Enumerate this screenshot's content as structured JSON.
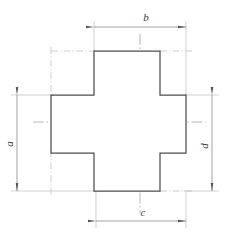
{
  "drawing": {
    "type": "engineering-dimension-drawing",
    "shape": "cross",
    "background_color": "#ffffff",
    "outline_color": "#4d4d4d",
    "dimension_line_color": "#8a8a8a",
    "centerline_color": "#9a9a9a",
    "extension_line_color": "#b0b0b0",
    "label_color": "#3a3a3a",
    "canvas": {
      "width": 243,
      "height": 241
    },
    "outline_points": "94,51 160,51 160,95 186,95 186,153 160,153 160,191 94,191 94,153 51,153 51,95 94,95",
    "geometry": {
      "left": 51,
      "right": 186,
      "top": 51,
      "bottom": 191,
      "arm_left": 94,
      "arm_right": 160,
      "arm_top": 95,
      "arm_bottom": 153
    },
    "centerlines": {
      "horizontal": {
        "x1": 33,
        "y1": 122,
        "x2": 206,
        "y2": 122
      },
      "vertical": {
        "x1": 140,
        "y1": 34,
        "x2": 140,
        "y2": 213
      }
    },
    "dimensions": [
      {
        "id": "b",
        "label": "b",
        "orientation": "horizontal",
        "position": "top",
        "line": {
          "x1": 94,
          "y1": 27,
          "x2": 186,
          "y2": 27
        },
        "label_x": 145,
        "label_y": 22,
        "measures": "top-arm-width-to-right-edge"
      },
      {
        "id": "c",
        "label": "c",
        "orientation": "horizontal",
        "position": "bottom",
        "line": {
          "x1": 96,
          "y1": 221,
          "x2": 186,
          "y2": 221
        },
        "label_x": 142,
        "label_y": 217,
        "measures": "bottom-arm-width"
      },
      {
        "id": "a",
        "label": "a",
        "orientation": "vertical",
        "position": "left",
        "line": {
          "x1": 17,
          "y1": 95,
          "x2": 17,
          "y2": 191
        },
        "label_x": 12,
        "label_y": 143,
        "measures": "overall-height-left"
      },
      {
        "id": "d",
        "label": "d",
        "orientation": "vertical",
        "position": "right",
        "line": {
          "x1": 212,
          "y1": 95,
          "x2": 212,
          "y2": 191
        },
        "label_x": 208,
        "label_y": 145,
        "measures": "height-right"
      }
    ],
    "extension_lines": [
      {
        "id": "ext-top-left",
        "x1": 94,
        "y1": 22,
        "x2": 94,
        "y2": 56
      },
      {
        "id": "ext-top-right",
        "x1": 186,
        "y1": 22,
        "x2": 186,
        "y2": 99
      },
      {
        "id": "ext-bottom-left",
        "x1": 96,
        "y1": 188,
        "x2": 96,
        "y2": 226
      },
      {
        "id": "ext-bottom-right",
        "x1": 186,
        "y1": 188,
        "x2": 186,
        "y2": 226
      },
      {
        "id": "ext-left-upper",
        "x1": 12,
        "y1": 95,
        "x2": 56,
        "y2": 95
      },
      {
        "id": "ext-left-lower",
        "x1": 12,
        "y1": 191,
        "x2": 99,
        "y2": 191
      },
      {
        "id": "ext-right-upper",
        "x1": 182,
        "y1": 95,
        "x2": 218,
        "y2": 95
      },
      {
        "id": "ext-right-lower",
        "x1": 182,
        "y1": 191,
        "x2": 218,
        "y2": 191
      }
    ],
    "construction_lines": [
      {
        "id": "constr-top-left-horizontal",
        "x1": 51,
        "y1": 51,
        "x2": 98,
        "y2": 51
      },
      {
        "id": "constr-top-left-vertical",
        "x1": 51,
        "y1": 47,
        "x2": 51,
        "y2": 98
      },
      {
        "id": "constr-top-right-extend",
        "x1": 160,
        "y1": 51,
        "x2": 190,
        "y2": 51
      },
      {
        "id": "constr-bottom-left-vertical",
        "x1": 51,
        "y1": 150,
        "x2": 51,
        "y2": 195
      },
      {
        "id": "constr-bottom-right-extend",
        "x1": 160,
        "y1": 191,
        "x2": 190,
        "y2": 191
      }
    ]
  }
}
